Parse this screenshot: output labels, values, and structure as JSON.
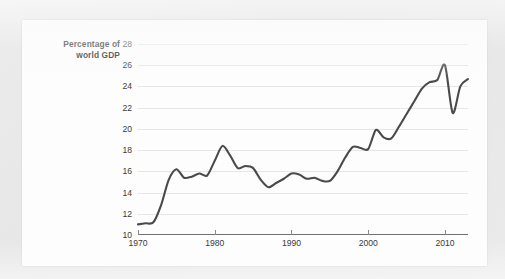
{
  "figure": {
    "y_axis_title_line1": "Percentage of",
    "y_axis_title_line2": "world GDP"
  },
  "chart_data": {
    "type": "line",
    "title": "",
    "subtitle": "",
    "xlabel": "",
    "ylabel": "Percentage of world GDP",
    "xlim": [
      1970,
      2013
    ],
    "ylim": [
      10,
      28
    ],
    "xticks": [
      1970,
      1980,
      1990,
      2000,
      2010
    ],
    "xtick_labels": [
      "1970",
      "1980",
      "1990",
      "2000",
      "2010"
    ],
    "yticks": [
      10,
      12,
      14,
      16,
      18,
      20,
      22,
      24,
      26,
      28
    ],
    "ytick_labels": [
      "10",
      "12",
      "14",
      "16",
      "18",
      "20",
      "22",
      "24",
      "26",
      "28"
    ],
    "grid": "horizontal",
    "legend": "none",
    "line_color": "#4a4a4a",
    "line_width": 2.1,
    "series": [
      {
        "name": "Percentage of world GDP",
        "x": [
          1970,
          1971,
          1972,
          1973,
          1974,
          1975,
          1976,
          1977,
          1978,
          1979,
          1980,
          1981,
          1982,
          1983,
          1984,
          1985,
          1986,
          1987,
          1988,
          1989,
          1990,
          1991,
          1992,
          1993,
          1994,
          1995,
          1996,
          1997,
          1998,
          1999,
          2000,
          2001,
          2002,
          2003,
          2004,
          2005,
          2006,
          2007,
          2008,
          2009,
          2010,
          2011,
          2012,
          2013
        ],
        "values": [
          11.0,
          11.1,
          11.2,
          12.8,
          15.2,
          16.2,
          15.4,
          15.5,
          15.8,
          15.6,
          17.0,
          18.4,
          17.5,
          16.3,
          16.5,
          16.3,
          15.2,
          14.5,
          14.9,
          15.3,
          15.8,
          15.7,
          15.3,
          15.4,
          15.1,
          15.1,
          16.0,
          17.3,
          18.3,
          18.2,
          18.1,
          19.9,
          19.2,
          19.1,
          20.2,
          21.4,
          22.6,
          23.8,
          24.4,
          24.6,
          26.0,
          21.5,
          24.0,
          24.7
        ]
      }
    ]
  }
}
